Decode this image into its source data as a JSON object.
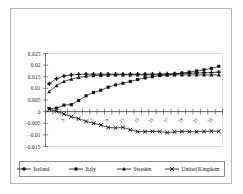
{
  "figure": {
    "outer_border_color": "#b9b9b9",
    "background": "#ffffff"
  },
  "chart_data": {
    "type": "line",
    "title": "",
    "subtitle": "",
    "xlabel": "",
    "ylabel": "",
    "grid": false,
    "legend_position": "bottom",
    "ylim": [
      -0.015,
      0.025
    ],
    "ytick_labels": [
      "0.025",
      "0.02",
      "0.015",
      "0.01",
      "0.005",
      "0",
      "-0.005",
      "-0.01",
      "-0.015"
    ],
    "ytick_values": [
      0.025,
      0.02,
      0.015,
      0.01,
      0.005,
      0,
      -0.005,
      -0.01,
      -0.015
    ],
    "x": [
      1,
      2,
      3,
      4,
      5,
      6,
      7,
      8,
      9,
      10,
      11,
      12,
      13,
      14,
      15,
      16,
      17,
      18,
      19,
      20,
      21,
      22,
      23,
      24
    ],
    "xtick_labels": [
      "",
      "",
      "3",
      "",
      "5",
      "",
      "7",
      "",
      "9",
      "",
      "11",
      "",
      "13",
      "",
      "15",
      "",
      "17",
      "",
      "19",
      "",
      "21",
      "",
      "23",
      ""
    ],
    "xtick_labels_rotated": true,
    "series": [
      {
        "name": "Ireland",
        "marker": "plus-cross",
        "color": "#111111",
        "values": [
          0.012,
          0.0142,
          0.0153,
          0.0158,
          0.016,
          0.0161,
          0.0161,
          0.0161,
          0.0161,
          0.0161,
          0.0161,
          0.0161,
          0.0161,
          0.0161,
          0.0161,
          0.0162,
          0.0162,
          0.0163,
          0.0164,
          0.0165,
          0.0166,
          0.0167,
          0.0168,
          0.017
        ]
      },
      {
        "name": "Italy",
        "marker": "square",
        "color": "#111111",
        "values": [
          0.0013,
          0.0015,
          0.0028,
          0.003,
          0.0048,
          0.0068,
          0.0082,
          0.0092,
          0.0105,
          0.0115,
          0.0122,
          0.013,
          0.0138,
          0.0145,
          0.015,
          0.0155,
          0.0158,
          0.0162,
          0.0166,
          0.017,
          0.0175,
          0.018,
          0.0186,
          0.0195
        ]
      },
      {
        "name": "Sweden",
        "marker": "triangle",
        "color": "#111111",
        "values": [
          0.0086,
          0.0112,
          0.013,
          0.014,
          0.0147,
          0.0152,
          0.0155,
          0.0156,
          0.0157,
          0.0158,
          0.0158,
          0.0158,
          0.0158,
          0.0158,
          0.0158,
          0.0158,
          0.0158,
          0.0158,
          0.0158,
          0.0158,
          0.0158,
          0.0158,
          0.0158,
          0.0158
        ]
      },
      {
        "name": "United Kingdom",
        "marker": "x-cross",
        "color": "#111111",
        "values": [
          0.001,
          0.0002,
          -0.001,
          -0.0022,
          -0.003,
          -0.0042,
          -0.005,
          -0.0058,
          -0.0068,
          -0.007,
          -0.0068,
          -0.0078,
          -0.0086,
          -0.0086,
          -0.0085,
          -0.0086,
          -0.009,
          -0.0087,
          -0.0085,
          -0.0086,
          -0.0087,
          -0.0085,
          -0.0084,
          -0.0085
        ]
      }
    ]
  },
  "legend": {
    "items": [
      {
        "label": "Ireland",
        "marker": "plus-cross"
      },
      {
        "label": "Italy",
        "marker": "square"
      },
      {
        "label": "Sweden",
        "marker": "triangle"
      },
      {
        "label": "United Kingdom",
        "marker": "x-cross"
      }
    ]
  }
}
